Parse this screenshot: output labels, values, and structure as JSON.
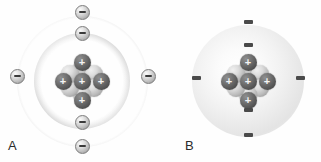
{
  "figure": {
    "kind": "atomic-model-comparison",
    "background_color": "#fefefe"
  },
  "panels": [
    {
      "id": "A",
      "label": "A",
      "label_x": 8,
      "label_y": 138,
      "model_name": "bohr-shell-model",
      "center": {
        "x": 82,
        "y": 81
      },
      "shells": [
        {
          "name": "inner-shell",
          "radius": 48,
          "electron_count": 2
        },
        {
          "name": "outer-shell",
          "radius": 65,
          "electron_count": 4
        }
      ],
      "electrons": [
        {
          "charge": "−",
          "x": 82,
          "y": 12,
          "shell": "outer"
        },
        {
          "charge": "−",
          "x": 82,
          "y": 33,
          "shell": "inner"
        },
        {
          "charge": "−",
          "x": 17,
          "y": 76,
          "shell": "outer"
        },
        {
          "charge": "−",
          "x": 148,
          "y": 76,
          "shell": "outer"
        },
        {
          "charge": "−",
          "x": 82,
          "y": 122,
          "shell": "inner"
        },
        {
          "charge": "−",
          "x": 82,
          "y": 146,
          "shell": "outer"
        }
      ],
      "nucleus": {
        "neutron_count": 6,
        "protons": [
          {
            "charge": "+",
            "x": 23,
            "y": 4
          },
          {
            "charge": "+",
            "x": 4,
            "y": 23
          },
          {
            "charge": "+",
            "x": 23,
            "y": 23
          },
          {
            "charge": "+",
            "x": 42,
            "y": 23
          },
          {
            "charge": "+",
            "x": 23,
            "y": 42
          }
        ]
      }
    },
    {
      "id": "B",
      "label": "B",
      "label_x": 185,
      "label_y": 138,
      "model_name": "electron-cloud-model",
      "center": {
        "x": 248,
        "y": 81
      },
      "cloud": {
        "radius": 56
      },
      "electrons": [
        {
          "charge": "−",
          "x": 248,
          "y": 22
        },
        {
          "charge": "−",
          "x": 248,
          "y": 45
        },
        {
          "charge": "−",
          "x": 196,
          "y": 78
        },
        {
          "charge": "−",
          "x": 300,
          "y": 78
        },
        {
          "charge": "−",
          "x": 248,
          "y": 110
        },
        {
          "charge": "−",
          "x": 248,
          "y": 135
        }
      ],
      "nucleus": {
        "neutron_count": 6,
        "protons": [
          {
            "charge": "+",
            "x": 23,
            "y": 4
          },
          {
            "charge": "+",
            "x": 4,
            "y": 23
          },
          {
            "charge": "+",
            "x": 23,
            "y": 23
          },
          {
            "charge": "+",
            "x": 42,
            "y": 23
          },
          {
            "charge": "+",
            "x": 23,
            "y": 42
          }
        ]
      }
    }
  ]
}
